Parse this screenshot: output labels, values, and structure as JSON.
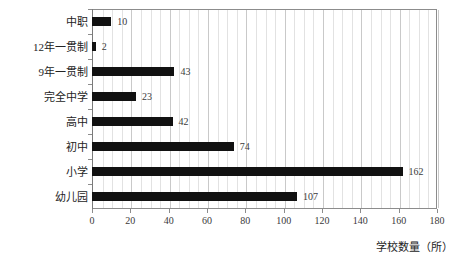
{
  "chart_data": {
    "type": "bar",
    "orientation": "horizontal",
    "title": "",
    "xlabel": "学校数量（所）",
    "ylabel": "",
    "categories": [
      "中职",
      "12年一贯制",
      "9年一贯制",
      "完全中学",
      "高中",
      "初中",
      "小学",
      "幼儿园"
    ],
    "values": [
      10,
      2,
      43,
      23,
      42,
      74,
      162,
      107
    ],
    "value_labels": [
      "10",
      "2",
      "43",
      "23",
      "42",
      "74",
      "162",
      "107"
    ],
    "xlim": [
      0,
      180
    ],
    "xticks": [
      0,
      20,
      40,
      60,
      80,
      100,
      120,
      140,
      160,
      180
    ],
    "xtick_labels": [
      "0",
      "20",
      "40",
      "60",
      "80",
      "100",
      "120",
      "140",
      "160",
      "180"
    ],
    "grid": "vertical",
    "legend": "none",
    "bar_color": "#111111",
    "grid_color": "#c9c9c9",
    "axis_color": "#8c8c8c"
  },
  "axes": {
    "x_title": "学校数量（所）"
  }
}
